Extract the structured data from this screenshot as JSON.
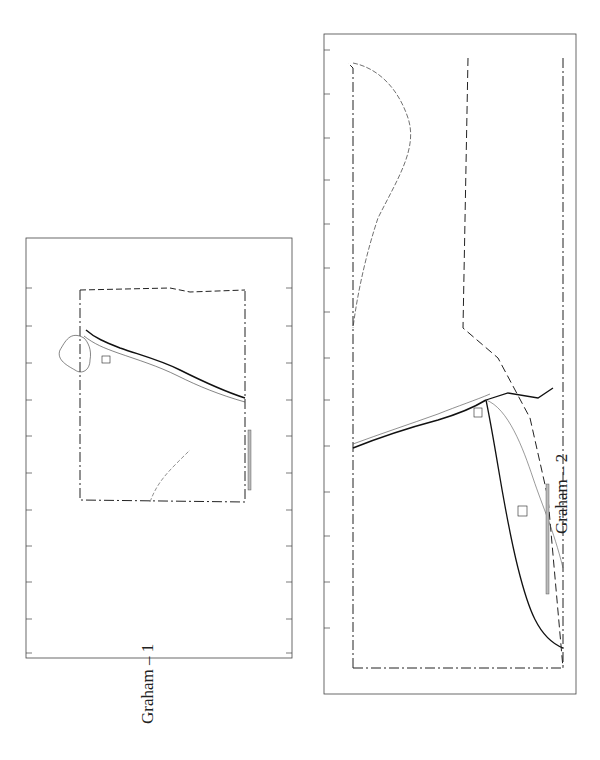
{
  "page": {
    "background": "#ffffff",
    "ink_color": "#1a1a1a"
  },
  "maps": [
    {
      "id": "graham-1",
      "caption": "Graham – 1",
      "row_labels": [
        "1",
        "2",
        "3",
        "4",
        "5",
        "6",
        "7",
        "8",
        "9",
        "10",
        "11"
      ],
      "column_labels": [
        "A",
        "B",
        "C",
        "D"
      ],
      "features": {
        "rivers": [
          "GILA RIVER",
          "ARAVAIPA CREEK",
          "BLACK RIVER",
          "SALT RIVER"
        ],
        "reservoir": "SAN CARLOS RESERVOIR",
        "route_shields": [
          "70"
        ],
        "scale_label": "10 Miles",
        "scale_start": "0"
      }
    },
    {
      "id": "graham-2",
      "caption": "Graham – 2",
      "row_labels": [
        "1",
        "2",
        "3",
        "4",
        "5",
        "6",
        "7",
        "8",
        "9",
        "10",
        "11",
        "12",
        "13",
        "14"
      ],
      "column_labels": [
        "A",
        "B",
        "C",
        "D",
        "E",
        "F",
        "G",
        "H"
      ],
      "features": {
        "rivers": [
          "GILA RIVER",
          "SAN SIMON CREEK",
          "BONITA CREEK",
          "BLACK RIVER"
        ],
        "town": "SAFFORD",
        "fort": "FT. GRANT",
        "route_shields": [
          "70",
          "666",
          "666",
          "70"
        ],
        "scale_label": "10 Miles",
        "scale_start": "0"
      }
    }
  ]
}
